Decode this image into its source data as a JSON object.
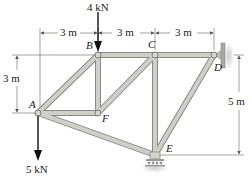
{
  "diagram": {
    "type": "truss",
    "colors": {
      "member_fill": "#c9c9c3",
      "member_edge": "#8a8a84",
      "dimension_line": "#555555",
      "arrow": "#111111",
      "wall": "#bdbdb8"
    },
    "joints": [
      {
        "id": "A",
        "label": "A",
        "x": 38,
        "y": 113
      },
      {
        "id": "B",
        "label": "B",
        "x": 98,
        "y": 55
      },
      {
        "id": "C",
        "label": "C",
        "x": 155,
        "y": 55
      },
      {
        "id": "D",
        "label": "D",
        "x": 214,
        "y": 55
      },
      {
        "id": "E",
        "label": "E",
        "x": 155,
        "y": 155
      },
      {
        "id": "F",
        "label": "F",
        "x": 98,
        "y": 113
      }
    ],
    "members": [
      [
        "A",
        "B"
      ],
      [
        "B",
        "C"
      ],
      [
        "C",
        "D"
      ],
      [
        "A",
        "F"
      ],
      [
        "B",
        "F"
      ],
      [
        "F",
        "C"
      ],
      [
        "C",
        "E"
      ],
      [
        "A",
        "E"
      ],
      [
        "E",
        "D"
      ]
    ],
    "loads": [
      {
        "joint": "B",
        "label": "4 kN",
        "direction": "down"
      },
      {
        "joint": "A",
        "label": "5 kN",
        "direction": "down"
      }
    ],
    "supports": [
      {
        "joint": "D",
        "type": "wall-pin"
      },
      {
        "joint": "E",
        "type": "roller"
      }
    ],
    "dimensions": {
      "top": [
        "3 m",
        "3 m",
        "3 m"
      ],
      "left": "3 m",
      "right": "5 m"
    }
  }
}
